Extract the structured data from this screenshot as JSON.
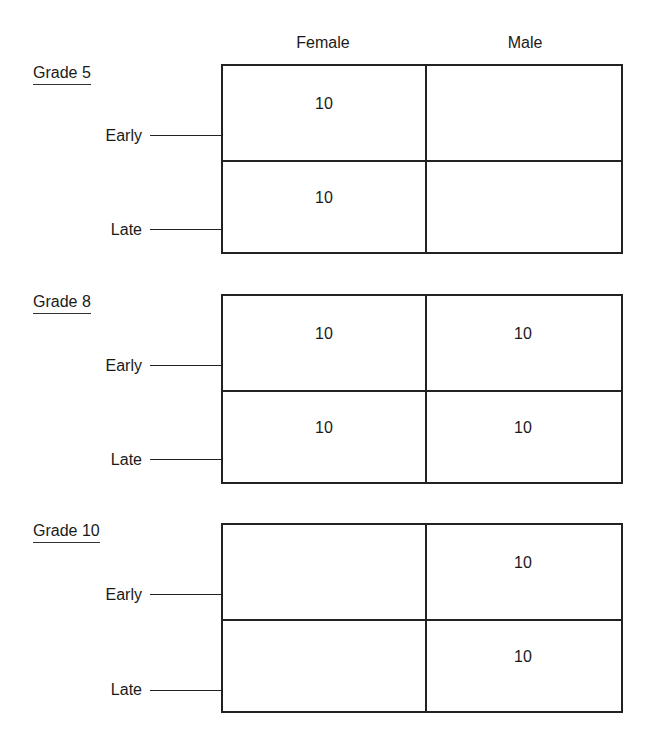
{
  "columns": [
    "Female",
    "Male"
  ],
  "rows": [
    "Early",
    "Late"
  ],
  "groups": [
    {
      "label": "Grade 5",
      "cells": {
        "early_female": "10",
        "early_male": "",
        "late_female": "10",
        "late_male": ""
      }
    },
    {
      "label": "Grade 8",
      "cells": {
        "early_female": "10",
        "early_male": "10",
        "late_female": "10",
        "late_male": "10"
      }
    },
    {
      "label": "Grade 10",
      "cells": {
        "early_female": "",
        "early_male": "10",
        "late_female": "",
        "late_male": "10"
      }
    }
  ]
}
